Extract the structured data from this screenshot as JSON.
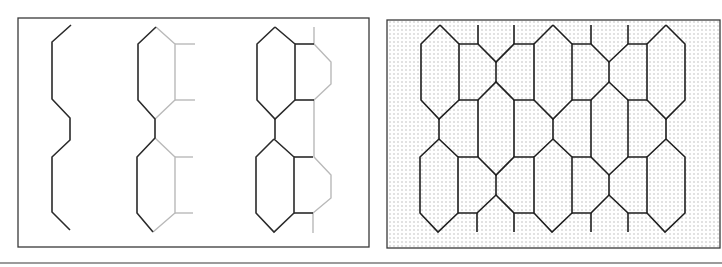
{
  "figure": {
    "colors": {
      "dark_line": "#2a2a2a",
      "light_line": "#b9b9b9",
      "frame": "#3a3a3a",
      "dot": "#8a8a8a",
      "separator": "#7a7a7a"
    }
  },
  "left_panel": {
    "frame": {
      "x": 18,
      "y": 18,
      "w": 351,
      "h": 229
    },
    "steps": [
      {
        "name": "step-1-zigzag-edge",
        "dark": [
          "71,25 52,42 52,99 70,118 70,140 52,157 52,212 70,230"
        ],
        "light": []
      },
      {
        "name": "step-2-hexagon-pair",
        "dark": [
          "156,27 138,44 138,100 155,119 155,138 137,157 137,213 153,232"
        ],
        "light": [
          "156,27 175,44 175,100 155,119",
          "175,44 195,44",
          "175,100 195,100",
          "155,138 175,157 175,213 153,232",
          "175,157 193,157",
          "175,213 193,213"
        ]
      },
      {
        "name": "step-3-hexagon-with-pentagon",
        "dark": [
          "275,27 257,44 257,100 275,119 295,100 295,44 275,27",
          "275,119 275,139",
          "295,44 314,44",
          "295,100 314,100",
          "274,139 256,157 256,213 274,232 294,213 294,157 274,139",
          "294,157 313,157",
          "294,213 313,213"
        ],
        "light": [
          "314,27 314,44 331,62 331,84 314,100 314,157 331,175 331,198 313,213 313,233"
        ]
      }
    ]
  },
  "right_panel": {
    "frame": {
      "x": 387,
      "y": 20,
      "w": 333,
      "h": 228
    },
    "dot_spacing": 4,
    "tessellation": [
      "440,25 421,44 421,100 439,119 459,100 459,44 440,25",
      "439,119 439,139",
      "439,139 420,157 420,213 438,232 458,213 458,157 439,139",
      "459,44 478,44 496,62 514,44 534,44",
      "478,25 478,44",
      "514,25 514,44",
      "496,62 496,82",
      "459,100 478,100 496,82 514,100 534,100",
      "478,100 478,157",
      "514,100 514,157",
      "553,25 534,44 534,100 553,119 572,100 572,44 553,25",
      "458,157 478,157 496,175 514,157 534,157",
      "496,175 496,195",
      "458,213 477,213 496,195 514,213 534,213",
      "477,213 477,232",
      "514,213 514,232",
      "553,119 553,139",
      "553,139 534,157 534,213 552,232 572,213 572,157 553,139",
      "572,44 591,44 609,62 628,44 647,44",
      "591,25 591,44",
      "628,25 628,44",
      "609,62 609,82",
      "572,100 591,100 609,82 628,100 647,100",
      "591,100 591,157",
      "628,100 628,157",
      "666,25 647,44 647,100 666,119 685,100 685,44 666,25",
      "666,119 666,139",
      "572,157 591,157 609,175 628,157 647,157",
      "609,175 609,195",
      "572,213 591,213 609,195 628,213 647,213",
      "591,213 591,232",
      "628,213 628,232",
      "666,139 647,157 647,213 665,232 685,213 685,157 666,139"
    ]
  },
  "separator": {
    "x1": 0,
    "y1": 263,
    "x2": 722,
    "y2": 263
  }
}
